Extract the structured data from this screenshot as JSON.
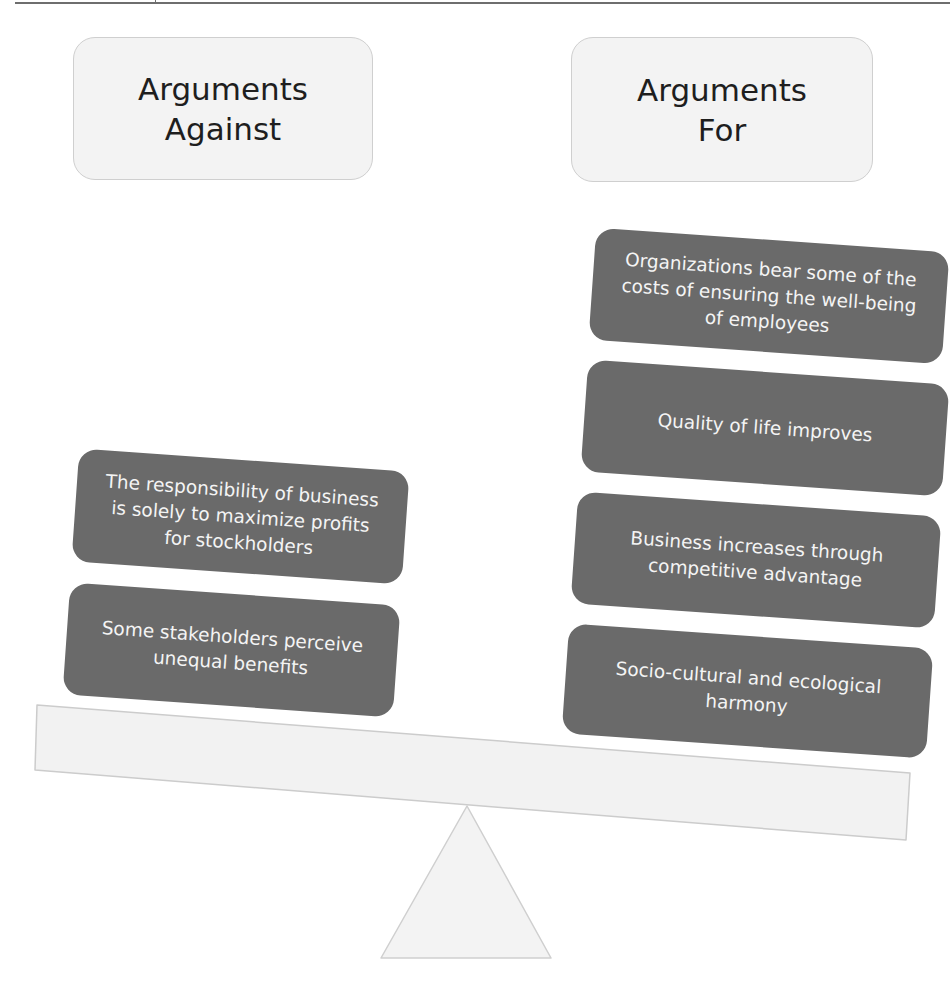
{
  "page": {
    "top_rule": true
  },
  "headers": {
    "against": {
      "line1": "Arguments",
      "line2": "Against"
    },
    "for": {
      "line1": "Arguments",
      "line2": "For"
    }
  },
  "arguments_against": [
    {
      "text": "The responsibility of business is solely to maximize profits for stockholders"
    },
    {
      "text": "Some stakeholders perceive unequal benefits"
    }
  ],
  "arguments_for": [
    {
      "text": "Organizations bear some of the costs of ensuring the well-being of employees"
    },
    {
      "text": "Quality of life improves"
    },
    {
      "text": "Business increases through competitive advantage"
    },
    {
      "text": "Socio-cultural and ecological harmony"
    }
  ],
  "colors": {
    "header_fill": "#f3f3f3",
    "header_border": "#cfcfcf",
    "card_fill": "#6a6a6a",
    "card_text": "#f4f4f4",
    "beam_fill": "#f2f2f2",
    "beam_border": "#cccccc",
    "fulcrum_fill": "#f3f3f3",
    "fulcrum_border": "#cfcfcf"
  },
  "scale": {
    "tilt": "right side lower (arguments for outweigh arguments against)"
  }
}
